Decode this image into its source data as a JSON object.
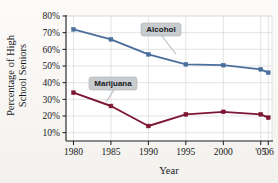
{
  "figure": {
    "background_color": "#fbfaf8",
    "plot_background_color": "#ffffff",
    "grid_color": "#d9d9d9",
    "axis_color": "#1a1a1a"
  },
  "chart_data": {
    "type": "line",
    "title": "",
    "xlabel": "Year",
    "ylabel": "Percentage of High School Seniors",
    "ylabel_line1": "Percentage of High",
    "ylabel_line2": "School Seniors",
    "categories": [
      "1980",
      "1985",
      "1990",
      "1995",
      "2000",
      "'05",
      "'06"
    ],
    "x_tick_labels": [
      "1980",
      "1985",
      "1990",
      "1995",
      "2000",
      "'05",
      "'06"
    ],
    "y_tick_labels": [
      "10%",
      "20%",
      "30%",
      "40%",
      "50%",
      "60%",
      "70%",
      "80%"
    ],
    "y_tick_values": [
      10,
      20,
      30,
      40,
      50,
      60,
      70,
      80
    ],
    "ylim": [
      5,
      80
    ],
    "xlim": [
      1979,
      2006.5
    ],
    "x_values": [
      1980,
      1985,
      1990,
      1995,
      2000,
      2005,
      2006
    ],
    "grid": true,
    "legend": "callout-labels",
    "series": [
      {
        "name": "Alcohol",
        "color": "#4a6f9c",
        "marker": "square",
        "values": [
          72,
          66,
          57,
          51,
          50.5,
          48,
          46
        ]
      },
      {
        "name": "Marijuana",
        "color": "#7d1733",
        "marker": "square",
        "values": [
          34,
          26,
          14,
          21,
          22.5,
          21,
          19
        ]
      }
    ],
    "annotations": [
      {
        "label": "Alcohol",
        "series": "Alcohol",
        "box_fill": "#c9ccce",
        "points_to_year": 1995
      },
      {
        "label": "Marijuana",
        "series": "Marijuana",
        "box_fill": "#c9ccce",
        "points_to_year": 1985
      }
    ]
  }
}
